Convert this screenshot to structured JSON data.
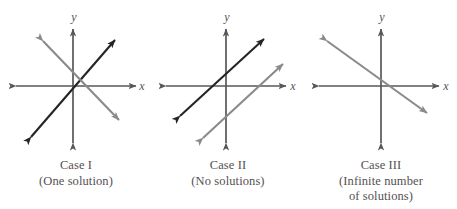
{
  "figure": {
    "background_color": "#ffffff",
    "axis_color": "#58565a",
    "dark_line_color": "#262327",
    "gray_line_color": "#8a8a8e",
    "text_color": "#555052"
  },
  "axis_labels": {
    "x": "x",
    "y": "y"
  },
  "panels": [
    {
      "id": "case-1",
      "title": "Case I",
      "subtitle": "(One solution)",
      "subtitle2": "",
      "description": "Two intersecting lines",
      "lines": [
        {
          "name": "line-dark-positive-slope",
          "color": "#262327",
          "slope": "positive"
        },
        {
          "name": "line-gray-negative-slope",
          "color": "#8a8a8e",
          "slope": "negative"
        }
      ]
    },
    {
      "id": "case-2",
      "title": "Case II",
      "subtitle": "(No solutions)",
      "subtitle2": "",
      "description": "Two parallel lines",
      "lines": [
        {
          "name": "line-dark-parallel-upper",
          "color": "#262327",
          "slope": "positive"
        },
        {
          "name": "line-gray-parallel-lower",
          "color": "#8a8a8e",
          "slope": "positive"
        }
      ]
    },
    {
      "id": "case-3",
      "title": "Case III",
      "subtitle": "(Infinite number",
      "subtitle2": "of solutions)",
      "description": "Two coincident lines",
      "lines": [
        {
          "name": "line-gray-coincident",
          "color": "#8a8a8e",
          "slope": "negative"
        }
      ]
    }
  ]
}
